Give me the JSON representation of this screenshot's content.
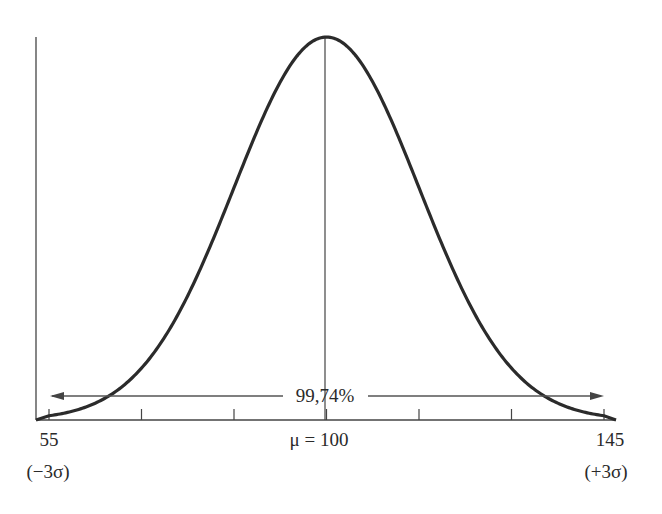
{
  "chart_data": {
    "type": "line",
    "title": "",
    "xlabel": "",
    "ylabel": "",
    "mean": 100,
    "sigma": 15,
    "xlim": [
      55,
      145
    ],
    "x_ticks": [
      55,
      70,
      85,
      100,
      115,
      130,
      145
    ],
    "labels": {
      "left_value": "55",
      "left_sigma": "(−3σ)",
      "center": "μ = 100",
      "right_value": "145",
      "right_sigma": "(+3σ)"
    },
    "annotation": {
      "text": "99,74%",
      "range": [
        55,
        145
      ],
      "arrow": "double-headed"
    },
    "grid": false,
    "legend": "none"
  }
}
